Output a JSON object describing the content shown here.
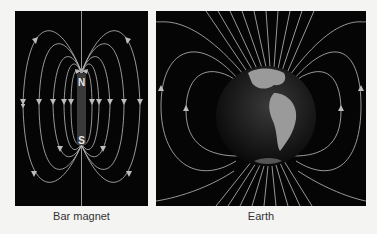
{
  "figure": {
    "panels": [
      {
        "id": "bar-magnet",
        "caption": "Bar magnet",
        "labels": {
          "north": "N",
          "south": "S"
        }
      },
      {
        "id": "earth",
        "caption": "Earth"
      }
    ],
    "colors": {
      "background": "#f4f4f2",
      "panel": "#050505",
      "field_lines": "#bdbdbd",
      "magnet_body": "#3a3a3a",
      "caption_text": "#333333"
    }
  }
}
